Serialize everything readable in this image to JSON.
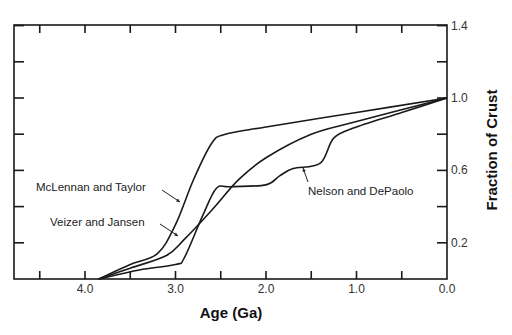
{
  "chart_data": {
    "type": "line",
    "title": "",
    "xlabel": "Age (Ga)",
    "ylabel": "Fraction of Crust",
    "xlim": [
      4.75,
      0.0
    ],
    "ylim": [
      0.0,
      1.4
    ],
    "x_reversed": true,
    "y_axis_position": "right",
    "grid": false,
    "x_ticks": [
      "4.0",
      "3.0",
      "2.0",
      "1.0",
      "0.0"
    ],
    "x_tick_values": [
      4.0,
      3.0,
      2.0,
      1.0,
      0.0
    ],
    "y_ticks": [
      "0.2",
      "0.6",
      "1.0",
      "1.4"
    ],
    "y_tick_values": [
      0.2,
      0.6,
      1.0,
      1.4
    ],
    "series": [
      {
        "name": "McLennan and Taylor",
        "x": [
          3.85,
          3.5,
          3.2,
          3.0,
          2.8,
          2.6,
          2.45,
          2.0,
          1.0,
          0.0
        ],
        "values": [
          0.0,
          0.08,
          0.14,
          0.3,
          0.55,
          0.75,
          0.8,
          0.84,
          0.92,
          1.0
        ]
      },
      {
        "name": "Veizer and Jansen",
        "x": [
          3.85,
          3.5,
          3.1,
          2.9,
          2.6,
          2.3,
          2.0,
          1.5,
          1.0,
          0.0
        ],
        "values": [
          0.0,
          0.06,
          0.13,
          0.22,
          0.38,
          0.55,
          0.67,
          0.8,
          0.87,
          1.0
        ]
      },
      {
        "name": "Nelson and DePaolo",
        "x": [
          3.85,
          3.4,
          3.0,
          2.9,
          2.7,
          2.55,
          2.4,
          2.0,
          1.85,
          1.7,
          1.4,
          1.25,
          1.0,
          0.5,
          0.0
        ],
        "values": [
          0.0,
          0.05,
          0.08,
          0.12,
          0.35,
          0.5,
          0.51,
          0.52,
          0.57,
          0.61,
          0.64,
          0.78,
          0.84,
          0.92,
          1.0
        ]
      }
    ],
    "annotations": [
      {
        "text": "McLennan and Taylor",
        "points_to": "McLennan and Taylor"
      },
      {
        "text": "Veizer and Jansen",
        "points_to": "Veizer and Jansen"
      },
      {
        "text": "Nelson and DePaolo",
        "points_to": "Nelson and DePaolo"
      }
    ]
  }
}
